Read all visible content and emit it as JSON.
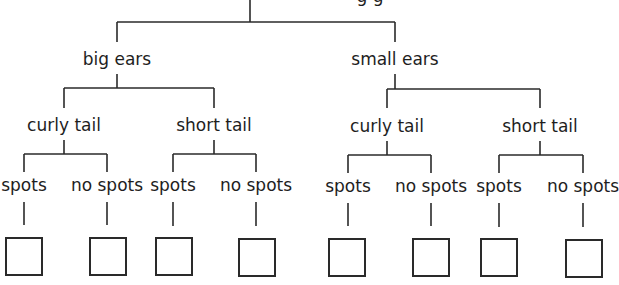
{
  "diagram": {
    "type": "decision-tree",
    "root": {
      "label_partially_visible": "g g",
      "x": 250
    },
    "level1": [
      {
        "label": "big ears",
        "x": 117
      },
      {
        "label": "small ears",
        "x": 395
      }
    ],
    "level2": [
      {
        "label": "curly tail",
        "x": 64
      },
      {
        "label": "short tail",
        "x": 214
      },
      {
        "label": "curly tail",
        "x": 387
      },
      {
        "label": "short tail",
        "x": 540
      }
    ],
    "level3": [
      {
        "label": "spots",
        "x": 24
      },
      {
        "label": "no spots",
        "x": 107
      },
      {
        "label": "spots",
        "x": 173
      },
      {
        "label": "no spots",
        "x": 256
      },
      {
        "label": "spots",
        "x": 348
      },
      {
        "label": "no spots",
        "x": 431
      },
      {
        "label": "spots",
        "x": 499
      },
      {
        "label": "no spots",
        "x": 583
      }
    ],
    "answer_boxes_count": 8,
    "line_color": "#2a2a2a"
  }
}
